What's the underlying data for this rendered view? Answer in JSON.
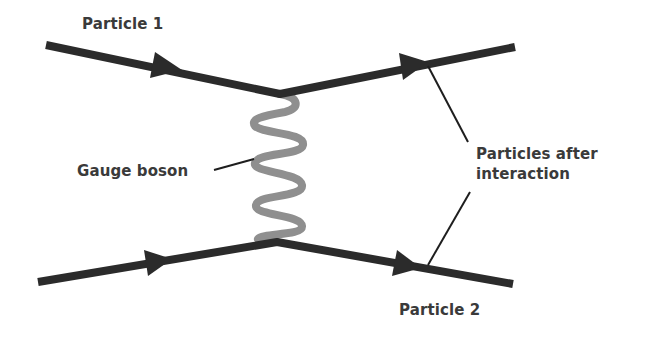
{
  "diagram": {
    "type": "feynman-diagram",
    "labels": {
      "particle_1": "Particle 1",
      "gauge_boson": "Gauge boson",
      "particles_after": {
        "line1": "Particles after",
        "line2": "interaction"
      },
      "particle_2": "Particle 2"
    },
    "colors": {
      "fermion_line": "#2b2b2b",
      "boson_line": "#8f8f8f",
      "leader_line": "#1e1e1e",
      "text": "#3a3a3a",
      "background": "#ffffff"
    },
    "fermion_lines": [
      {
        "name": "particle-1-incoming",
        "from": [
          46,
          45
        ],
        "to": [
          280,
          94
        ]
      },
      {
        "name": "particle-1-outgoing",
        "from": [
          280,
          94
        ],
        "to": [
          515,
          47
        ]
      },
      {
        "name": "particle-2-incoming",
        "from": [
          38,
          282
        ],
        "to": [
          277,
          242
        ]
      },
      {
        "name": "particle-2-outgoing",
        "from": [
          277,
          242
        ],
        "to": [
          513,
          284
        ]
      }
    ],
    "boson_line": {
      "from": [
        280,
        94
      ],
      "to": [
        277,
        242
      ],
      "oscillations": 6
    },
    "arrows": [
      {
        "name": "arrow-particle-1-in",
        "tip": [
          177,
          70
        ]
      },
      {
        "name": "arrow-particle-1-out",
        "tip": [
          425,
          63
        ]
      },
      {
        "name": "arrow-particle-2-in",
        "tip": [
          168,
          260
        ]
      },
      {
        "name": "arrow-particle-2-out",
        "tip": [
          416,
          267
        ]
      }
    ]
  }
}
